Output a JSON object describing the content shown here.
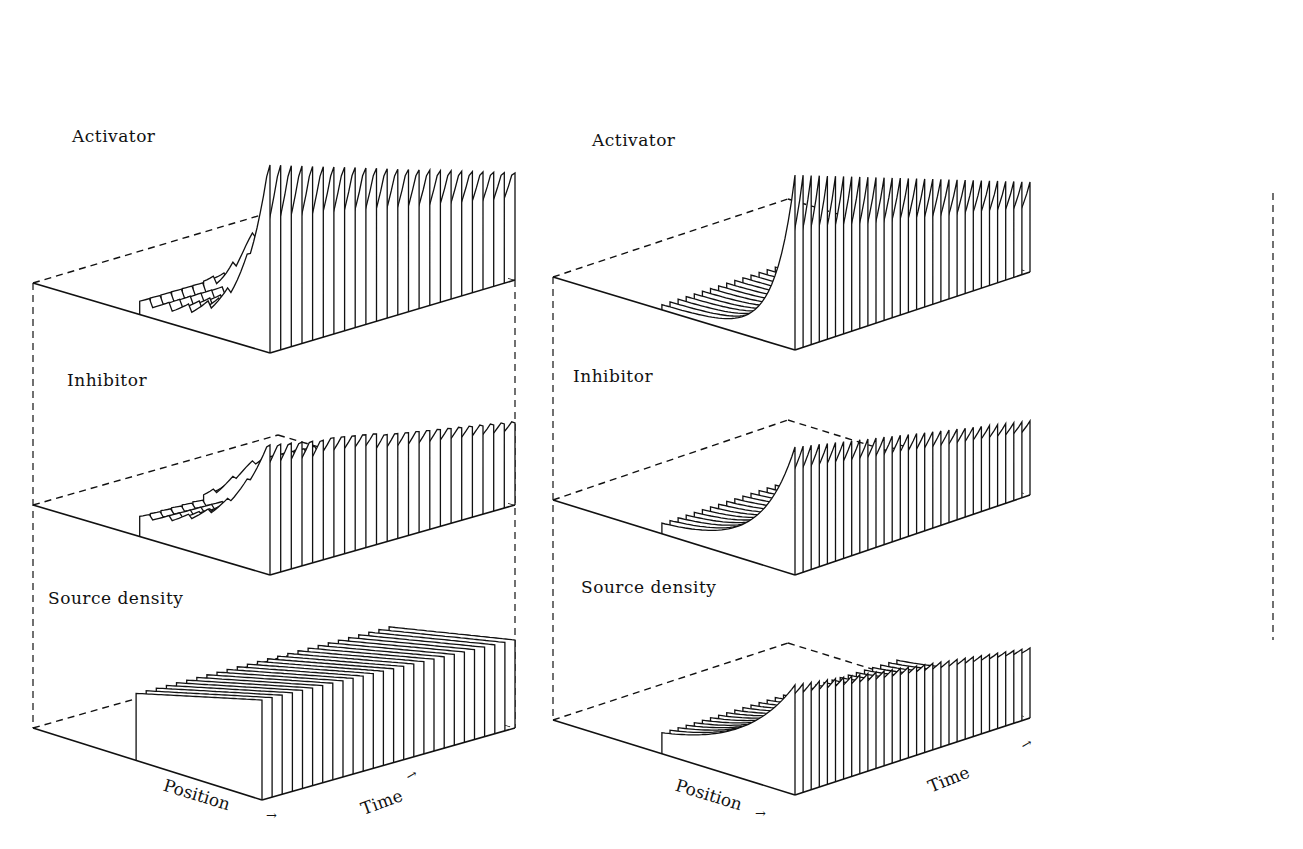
{
  "figure": {
    "panels": [
      {
        "id": "left",
        "layers": [
          {
            "label": "Activator",
            "label_pos": [
              72,
              140
            ]
          },
          {
            "label": "Inhibitor",
            "label_pos": [
              67,
              383
            ]
          },
          {
            "label": "Source density",
            "label_pos": [
              50,
              600
            ]
          }
        ],
        "axis_position": "Position",
        "axis_time": "Time",
        "position_label_pos": [
          163,
          781
        ],
        "time_label_pos": [
          355,
          800
        ]
      },
      {
        "id": "right",
        "layers": [
          {
            "label": "Activator",
            "label_pos": [
              593,
              130
            ]
          },
          {
            "label": "Inhibitor",
            "label_pos": [
              573,
              396
            ]
          },
          {
            "label": "Source density",
            "label_pos": [
              582,
              578
            ]
          }
        ],
        "axis_position": "Position",
        "axis_time": "Time",
        "position_label_pos": [
          680,
          795
        ],
        "time_label_pos": [
          922,
          775
        ]
      }
    ]
  },
  "chart_data": [
    {
      "type": "3d-waterfall",
      "title": "",
      "panel": "left",
      "xlabel": "Position",
      "ylabel": "Time",
      "series": [
        {
          "name": "Activator",
          "description": "Sharp peak near one boundary rising over time; secondary transient peak mid-field; saw-tooth baseline elsewhere"
        },
        {
          "name": "Inhibitor",
          "description": "Broad smooth peak near boundary; transient hump mid-field; saw-tooth baseline"
        },
        {
          "name": "Source density",
          "description": "Gradient slowly rising toward one end; nearly flat plateau over time"
        }
      ]
    },
    {
      "type": "3d-waterfall",
      "title": "",
      "panel": "right",
      "xlabel": "Position",
      "ylabel": "Time",
      "series": [
        {
          "name": "Activator",
          "description": "Two sharp peaks at boundaries growing and decaying exponentially in position"
        },
        {
          "name": "Inhibitor",
          "description": "Two peaks at boundaries with exponential decay in position"
        },
        {
          "name": "Source density",
          "description": "Two smooth exponentially decaying profiles from boundaries"
        }
      ]
    }
  ]
}
